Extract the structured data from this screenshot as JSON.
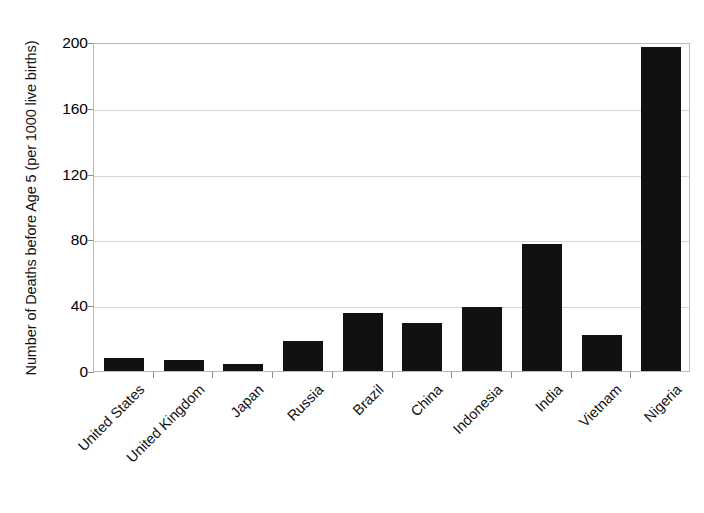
{
  "chart_data": {
    "type": "bar",
    "title": "",
    "xlabel": "",
    "ylabel": "Number of Deaths before Age 5 (per 1000 live births)",
    "categories": [
      "United States",
      "United Kingdom",
      "Japan",
      "Russia",
      "Brazil",
      "China",
      "Indonesia",
      "India",
      "Vietnam",
      "Nigeria"
    ],
    "values": [
      8,
      7,
      4,
      18,
      35,
      29,
      39,
      77,
      22,
      197
    ],
    "ylim": [
      0,
      200
    ],
    "ytick_values": [
      0,
      40,
      80,
      120,
      160,
      200
    ],
    "ytick_labels": [
      "0",
      "40",
      "80",
      "120",
      "160",
      "200"
    ],
    "grid": "horizontal",
    "legend": "none",
    "bar_color": "#111111",
    "gridline_color": "#d6d6d6",
    "frame_color": "#b9b9b9",
    "background_color": "#ffffff"
  }
}
